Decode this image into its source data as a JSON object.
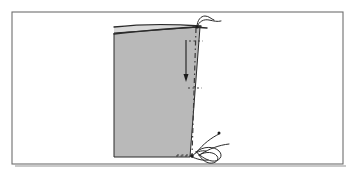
{
  "figure": {
    "kind": "technical-illustration",
    "canvas": {
      "width": 353,
      "height": 178,
      "background": "#ffffff"
    },
    "border": {
      "name": "figure-frame",
      "x": 12,
      "y": 12,
      "width": 331,
      "height": 152,
      "stroke": "#6e6e6e",
      "stroke_width": 1.1,
      "fill": "none"
    },
    "shadow": {
      "name": "frame-drop-shadow",
      "x": 15,
      "y": 165,
      "width": 331,
      "height": 2,
      "color": "#c9c9c9"
    },
    "fabric": {
      "name": "fabric-panel",
      "fill": "#b9b9b9",
      "stroke": "#2b2b2b",
      "stroke_width": 1.0,
      "points": "114,33 200,27 190,157 114,157"
    },
    "fold_wedge": {
      "name": "fabric-fold-wedge",
      "fill": "#d9d9d9",
      "stroke": "none",
      "points": "114,26 201,26 199,28 114,33"
    },
    "fold_edge_upper": {
      "name": "fold-edge-upper-line",
      "stroke": "#2b2b2b",
      "stroke_width": 1.3,
      "path": "M114,27 C140,24 172,24 201,26"
    },
    "fold_edge_lower": {
      "name": "fold-edge-lower-line",
      "stroke": "#2b2b2b",
      "stroke_width": 1.4,
      "path": "M114,34 C142,31 173,28 201,27"
    },
    "top_cap_line": {
      "name": "fabric-top-cap-line",
      "stroke": "#2b2b2b",
      "stroke_width": 1.4,
      "path": "M193,27 L207,28"
    },
    "stitch_line": {
      "name": "basting-stitch-dashed-line",
      "stroke": "#3a3a3a",
      "stroke_width": 1.2,
      "dash_pattern": "5 3 1.5 3",
      "x_top": 196,
      "y_top": 28,
      "x_bottom": 192,
      "y_bottom": 156
    },
    "stitch_ticks": {
      "name": "stitch-cross-ticks",
      "stroke": "#3a3a3a",
      "stroke_width": 1.1,
      "rows": [
        {
          "y": 41,
          "x1": 189,
          "x2": 203
        },
        {
          "y": 88,
          "x1": 188,
          "x2": 202
        },
        {
          "y": 155,
          "x1": 177,
          "x2": 195
        }
      ]
    },
    "direction_arrow": {
      "name": "pull-direction-arrow",
      "stroke": "#2b2b2b",
      "stroke_width": 1.2,
      "fill": "#1c1c1c",
      "x": 186,
      "y_start": 40,
      "y_end": 82,
      "head_width": 5,
      "head_height": 8,
      "label": "pull direction"
    },
    "thread_tails_top": {
      "name": "thread-tails-top",
      "stroke": "#2b2b2b",
      "stroke_width": 1.0,
      "anchor_x": 197,
      "anchor_y": 27,
      "paths": [
        "M197,27 C197,20 201,16 205,16 C209,16 211,19 214,20",
        "M197,27 C199,21 204,19 209,20 C214,21 217,22 221,21"
      ]
    },
    "thread_anchor_top": {
      "name": "thread-anchor-dot-top",
      "fill": "#1c1c1c",
      "cx": 197,
      "cy": 27,
      "r": 1.6
    },
    "knot": {
      "name": "thread-knot-bottom",
      "stroke": "#2b2b2b",
      "stroke_width": 1.0,
      "fill": "none",
      "anchor_x": 192,
      "anchor_y": 156,
      "loops": [
        "M196,152 C203,146 214,146 219,151 C224,156 219,162 212,161 C205,160 200,155 196,152 Z",
        "M199,155 C206,151 214,152 217,156 C220,160 215,164 209,163 C204,162 201,158 199,155 Z",
        "M192,156 C196,152 201,150 206,151"
      ],
      "tails": [
        "M197,152 C203,144 211,138 219,134",
        "M201,154 C209,149 219,145 229,144",
        "M192,157 C197,159 203,161 208,160"
      ],
      "tail_dot": {
        "cx": 219,
        "cy": 133,
        "r": 1.5,
        "fill": "#1c1c1c"
      },
      "anchor_dot": {
        "cx": 192,
        "cy": 156,
        "r": 1.8,
        "fill": "#1c1c1c"
      }
    },
    "bottom_dotted_run": {
      "name": "bottom-dotted-stitch-run",
      "stroke": "#3a3a3a",
      "stroke_width": 1.2,
      "dash_pattern": "2 2.5",
      "x1": 176,
      "x2": 192,
      "y": 156
    }
  },
  "accessibility": {
    "alt_text": "Line drawing of a slanted fabric panel with a dashed basting stitch line running down the right edge, a downward arrow indicating pulling direction, thread tails at the top point and a knotted thread at the bottom corner."
  }
}
